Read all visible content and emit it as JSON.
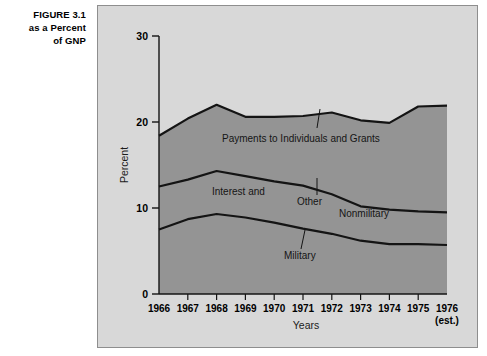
{
  "figure": {
    "caption_line1": "FIGURE 3.1",
    "caption_line2": "as a Percent",
    "caption_line3": "of GNP"
  },
  "colors": {
    "panel_background": "#d8d8d8",
    "area_fill": "#949494",
    "curve": "#141414",
    "frame_border": "#8e8e8e",
    "text": "#000000"
  },
  "chart_data": {
    "type": "area",
    "title": "",
    "xlabel": "Years",
    "ylabel": "Percent",
    "x": [
      1966,
      1967,
      1968,
      1969,
      1970,
      1971,
      1972,
      1973,
      1974,
      1975,
      1976
    ],
    "xtick_labels": [
      "1966",
      "1967",
      "1968",
      "1969",
      "1970",
      "1971",
      "1972",
      "1973",
      "1974",
      "1975",
      "1976"
    ],
    "xtick_note": "(est.)",
    "xtick_note_on": "1976",
    "ytick_labels": [
      "0",
      "10",
      "20",
      "30"
    ],
    "yticks": [
      0,
      10,
      20,
      30
    ],
    "ylim": [
      0,
      30
    ],
    "xlim": [
      1966,
      1976
    ],
    "grid": false,
    "legend_position": "inline-annotations",
    "stacked": true,
    "cumulative_series": [
      {
        "name": "Military",
        "role": "lowest-boundary",
        "values": [
          7.5,
          8.7,
          9.3,
          8.9,
          8.3,
          7.6,
          7.0,
          6.2,
          5.8,
          5.8,
          5.7
        ]
      },
      {
        "name": "Interest and Other Nonmilitary",
        "role": "middle-boundary",
        "values": [
          12.5,
          13.3,
          14.3,
          13.7,
          13.1,
          12.6,
          11.6,
          10.2,
          9.8,
          9.6,
          9.5
        ]
      },
      {
        "name": "Payments to Individuals and Grants",
        "role": "upper-boundary",
        "values": [
          18.4,
          20.4,
          22.0,
          20.6,
          20.6,
          20.7,
          21.1,
          20.2,
          19.9,
          21.8,
          21.9
        ]
      }
    ],
    "annotations": [
      {
        "text": "Payments to Individuals and Grants",
        "leader": true
      },
      {
        "text": "Interest and",
        "leader": false
      },
      {
        "text": "Other",
        "leader": true
      },
      {
        "text": "Nonmilitary",
        "leader": false
      },
      {
        "text": "Military",
        "leader": true
      }
    ]
  }
}
